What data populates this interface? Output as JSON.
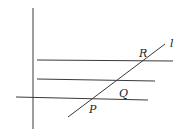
{
  "diagram": {
    "labels": {
      "R": "R",
      "Q": "Q",
      "P": "P",
      "l": "l"
    },
    "lines": {
      "vertical": {
        "x1": 33,
        "y1": 8,
        "x2": 33,
        "y2": 129
      },
      "top_horizontal": {
        "x1": 37,
        "y1": 60,
        "x2": 173,
        "y2": 61
      },
      "middle_horizontal": {
        "x1": 37,
        "y1": 79,
        "x2": 155,
        "y2": 81
      },
      "bottom_horizontal": {
        "x1": 16,
        "y1": 97,
        "x2": 148,
        "y2": 100
      },
      "transversal_l": {
        "x1": 68,
        "y1": 117,
        "x2": 165,
        "y2": 44
      }
    }
  }
}
